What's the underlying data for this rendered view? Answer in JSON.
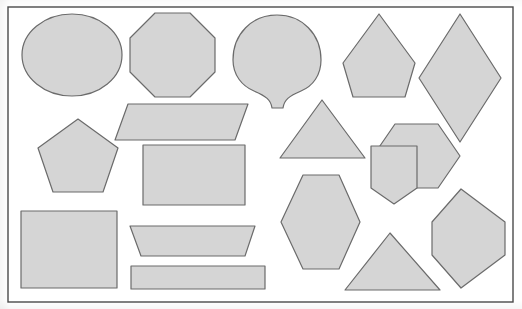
{
  "page": {
    "width": 522,
    "height": 309,
    "background_color": "#ffffff"
  },
  "style": {
    "shape_fill": "#d5d5d5",
    "shape_stroke": "#6b6b6b",
    "shape_stroke_width": 1.2,
    "border_stroke": "#4a4a4a",
    "border_stroke_width": 1.4
  },
  "frame": {
    "name": "outer-border",
    "x": 8,
    "y": 7,
    "width": 505,
    "height": 295
  },
  "shapes": [
    {
      "id": "circle",
      "label": "Circle",
      "sides": 0,
      "kind": "ellipse",
      "cx": 72,
      "cy": 55,
      "rx": 50,
      "ry": 41
    },
    {
      "id": "octagon",
      "label": "Octagon",
      "sides": 8,
      "kind": "polygon",
      "points": "155,13 190,13 215,38 215,72 190,97 155,97 130,72 130,38"
    },
    {
      "id": "fan",
      "label": "Fan",
      "sides": 0,
      "kind": "path",
      "d": "M 277 15 C 252 15 233 34 233 60 C 233 75 242 86 254 91 C 266 96 271 100 272 108 L 283 108 C 284 100 289 96 301 91 C 313 86 321 75 321 60 C 321 34 302 15 277 15 Z"
    },
    {
      "id": "pentagon-point-up",
      "label": "Pentagon",
      "sides": 5,
      "kind": "polygon",
      "points": "379,14 415,63 405,97 353,97 343,63"
    },
    {
      "id": "rhombus",
      "label": "Rhombus",
      "sides": 4,
      "kind": "polygon",
      "points": "460,14 501,78 460,142 419,78"
    },
    {
      "id": "parallelogram",
      "label": "Parallelogram",
      "sides": 4,
      "kind": "polygon",
      "points": "128,104 248,104 235,140 115,140"
    },
    {
      "id": "pentagon-regular",
      "label": "Pentagon",
      "sides": 5,
      "kind": "polygon",
      "points": "78,119 118,148 103,192 53,192 38,148"
    },
    {
      "id": "triangle-upper",
      "label": "Triangle",
      "sides": 3,
      "kind": "polygon",
      "points": "322,100 365,158 280,158"
    },
    {
      "id": "hexagon-right",
      "label": "Hexagon",
      "sides": 6,
      "kind": "polygon",
      "points": "395,124 438,124 460,156 438,188 395,188 373,156"
    },
    {
      "id": "rectangle",
      "label": "Rectangle",
      "sides": 4,
      "kind": "polygon",
      "points": "143,145 245,145 245,205 143,205"
    },
    {
      "id": "pentagon-home-plate",
      "label": "Pentagon",
      "sides": 5,
      "kind": "polygon",
      "points": "371,146 371,188 394,204 417,188 417,146"
    },
    {
      "id": "hexagon-lower",
      "label": "Hexagon",
      "sides": 6,
      "kind": "polygon",
      "points": "303,175 339,175 360,222 339,269 303,269 281,222"
    },
    {
      "id": "square",
      "label": "Square",
      "sides": 4,
      "kind": "polygon",
      "points": "21,211 117,211 117,288 21,288"
    },
    {
      "id": "trapezoid",
      "label": "Trapezoid",
      "sides": 4,
      "kind": "polygon",
      "points": "130,226 255,226 245,256 141,256"
    },
    {
      "id": "thin-rectangle",
      "label": "Rectangle",
      "sides": 4,
      "kind": "polygon",
      "points": "131,266 265,266 265,289 131,289"
    },
    {
      "id": "triangle-lower",
      "label": "Triangle",
      "sides": 3,
      "kind": "polygon",
      "points": "390,233 440,290 345,290"
    },
    {
      "id": "hexagon-elongated",
      "label": "Hexagon",
      "sides": 6,
      "kind": "polygon",
      "points": "461,189 505,222 505,255 461,288 432,255 432,222"
    }
  ]
}
